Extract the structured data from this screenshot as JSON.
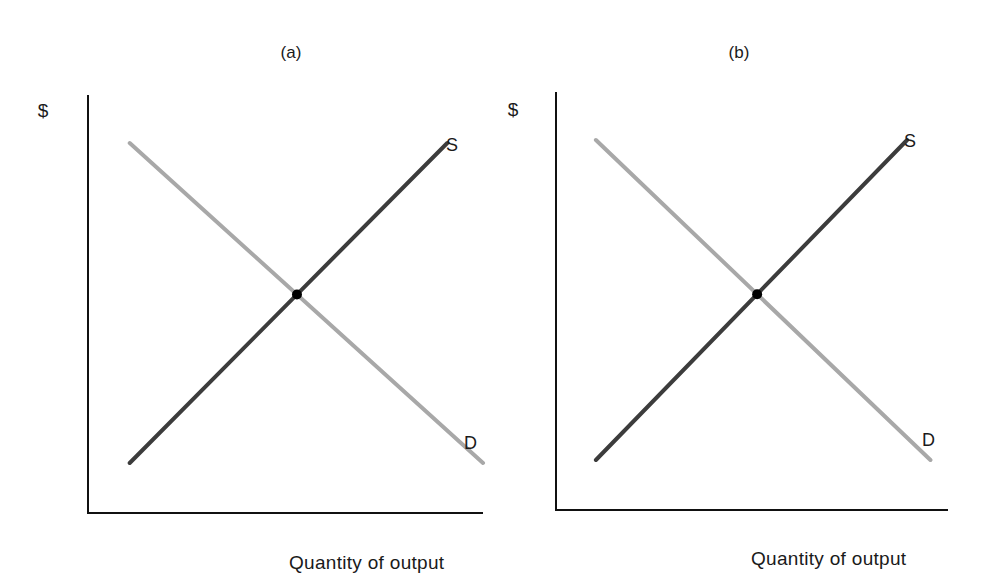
{
  "colors": {
    "supply": "#3c3c3c",
    "demand": "#a8a8a8",
    "axis": "#111111",
    "equilibrium": "#000000"
  },
  "chart_data": [
    {
      "type": "line",
      "title": "(a)",
      "xlabel": "Quantity of output",
      "ylabel": "$",
      "xlim": [
        0,
        10
      ],
      "ylim": [
        0,
        10
      ],
      "grid": false,
      "ticks": false,
      "series": [
        {
          "name": "S",
          "label": "S",
          "kind": "supply",
          "points": [
            [
              1,
              1
            ],
            [
              9,
              9
            ]
          ]
        },
        {
          "name": "D",
          "label": "D",
          "kind": "demand",
          "points": [
            [
              1,
              9
            ],
            [
              9.9,
              1
            ]
          ]
        }
      ],
      "equilibrium": {
        "x": 5.1,
        "y": 5.1
      }
    },
    {
      "type": "line",
      "title": "(b)",
      "xlabel": "Quantity of output",
      "ylabel": "$",
      "xlim": [
        0,
        10
      ],
      "ylim": [
        0,
        10
      ],
      "grid": false,
      "ticks": false,
      "series": [
        {
          "name": "S",
          "label": "S",
          "kind": "supply",
          "points": [
            [
              1,
              1
            ],
            [
              9,
              9
            ]
          ]
        },
        {
          "name": "D",
          "label": "D",
          "kind": "demand",
          "points": [
            [
              1,
              9
            ],
            [
              9.6,
              1
            ]
          ]
        }
      ],
      "equilibrium": {
        "x": 5.0,
        "y": 5.0
      }
    }
  ]
}
